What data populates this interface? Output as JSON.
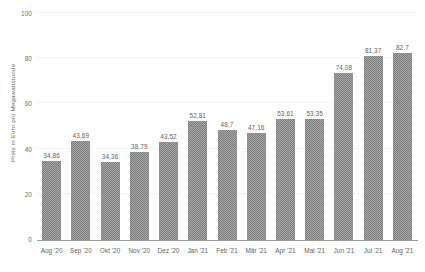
{
  "chart_data": {
    "type": "bar",
    "title": "",
    "subtitle": "",
    "xlabel": "",
    "ylabel": "Preis in Euro pro Megawattstunde",
    "ylim": [
      0,
      100
    ],
    "yticks": [
      0,
      20,
      40,
      60,
      80,
      100
    ],
    "ytick_labels": [
      "0",
      "20",
      "40",
      "60",
      "80",
      "100"
    ],
    "grid": true,
    "legend": null,
    "legend_position": "none",
    "bar_color": "#7e7e7e",
    "categories": [
      "Aug '20",
      "Sep '20",
      "Okt '20",
      "Nov '20",
      "Dez '20",
      "Jan '21",
      "Feb '21",
      "Mär '21",
      "Apr '21",
      "Mai '21",
      "Jun '21",
      "Jul '21",
      "Aug '21"
    ],
    "values": [
      34.86,
      43.69,
      34.36,
      38.79,
      43.52,
      52.81,
      48.7,
      47.16,
      53.61,
      53.35,
      74.08,
      81.37,
      82.7
    ],
    "value_labels": [
      "34,86",
      "43,69",
      "34,36",
      "38,79",
      "43,52",
      "52,81",
      "48,7",
      "47,16",
      "53,61",
      "53,35",
      "74,08",
      "81,37",
      "82,7"
    ]
  }
}
